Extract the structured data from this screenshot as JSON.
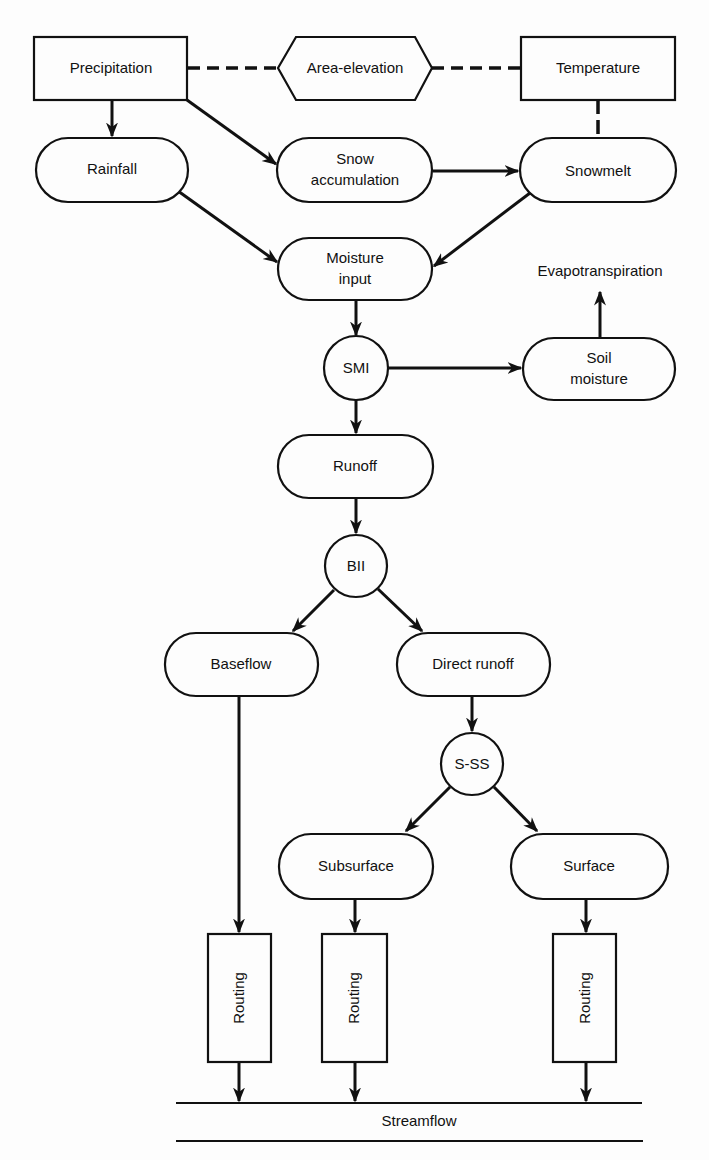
{
  "diagram": {
    "nodes": {
      "precipitation": {
        "label": "Precipitation",
        "shape": "rectangle"
      },
      "area_elevation": {
        "label": "Area-elevation",
        "shape": "hexagon"
      },
      "temperature": {
        "label": "Temperature",
        "shape": "rectangle"
      },
      "rainfall": {
        "label": "Rainfall",
        "shape": "stadium"
      },
      "snow_accumulation": {
        "line1": "Snow",
        "line2": "accumulation",
        "shape": "stadium"
      },
      "snowmelt": {
        "label": "Snowmelt",
        "shape": "stadium"
      },
      "moisture_input": {
        "line1": "Moisture",
        "line2": "input",
        "shape": "stadium"
      },
      "evapotranspiration": {
        "label": "Evapotranspiration",
        "shape": "text"
      },
      "smi": {
        "label": "SMI",
        "shape": "circle"
      },
      "soil_moisture": {
        "line1": "Soil",
        "line2": "moisture",
        "shape": "stadium"
      },
      "runoff": {
        "label": "Runoff",
        "shape": "stadium"
      },
      "bii": {
        "label": "BII",
        "shape": "circle"
      },
      "baseflow": {
        "label": "Baseflow",
        "shape": "stadium"
      },
      "direct_runoff": {
        "label": "Direct runoff",
        "shape": "stadium"
      },
      "s_ss": {
        "label": "S-SS",
        "shape": "circle"
      },
      "subsurface": {
        "label": "Subsurface",
        "shape": "stadium"
      },
      "surface": {
        "label": "Surface",
        "shape": "stadium"
      },
      "routing_1": {
        "label": "Routing",
        "shape": "rectangle-vertical"
      },
      "routing_2": {
        "label": "Routing",
        "shape": "rectangle-vertical"
      },
      "routing_3": {
        "label": "Routing",
        "shape": "rectangle-vertical"
      },
      "streamflow": {
        "label": "Streamflow",
        "shape": "band"
      }
    },
    "edges": [
      {
        "from": "Precipitation",
        "to": "Area-elevation",
        "style": "dashed"
      },
      {
        "from": "Area-elevation",
        "to": "Temperature",
        "style": "dashed"
      },
      {
        "from": "Temperature",
        "to": "Snowmelt",
        "style": "dashed"
      },
      {
        "from": "Precipitation",
        "to": "Rainfall",
        "style": "arrow"
      },
      {
        "from": "Precipitation",
        "to": "Snow accumulation",
        "style": "arrow"
      },
      {
        "from": "Snow accumulation",
        "to": "Snowmelt",
        "style": "arrow"
      },
      {
        "from": "Rainfall",
        "to": "Moisture input",
        "style": "arrow"
      },
      {
        "from": "Snowmelt",
        "to": "Moisture input",
        "style": "arrow"
      },
      {
        "from": "Moisture input",
        "to": "SMI",
        "style": "arrow"
      },
      {
        "from": "SMI",
        "to": "Soil moisture",
        "style": "arrow"
      },
      {
        "from": "Soil moisture",
        "to": "Evapotranspiration",
        "style": "arrow"
      },
      {
        "from": "SMI",
        "to": "Runoff",
        "style": "arrow"
      },
      {
        "from": "Runoff",
        "to": "BII",
        "style": "arrow"
      },
      {
        "from": "BII",
        "to": "Baseflow",
        "style": "arrow"
      },
      {
        "from": "BII",
        "to": "Direct runoff",
        "style": "arrow"
      },
      {
        "from": "Direct runoff",
        "to": "S-SS",
        "style": "arrow"
      },
      {
        "from": "S-SS",
        "to": "Subsurface",
        "style": "arrow"
      },
      {
        "from": "S-SS",
        "to": "Surface",
        "style": "arrow"
      },
      {
        "from": "Baseflow",
        "to": "Routing",
        "style": "arrow"
      },
      {
        "from": "Subsurface",
        "to": "Routing",
        "style": "arrow"
      },
      {
        "from": "Surface",
        "to": "Routing",
        "style": "arrow"
      },
      {
        "from": "Routing",
        "to": "Streamflow",
        "style": "arrow"
      }
    ]
  }
}
